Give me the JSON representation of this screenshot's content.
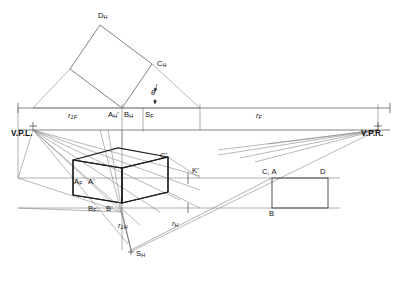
{
  "figure": {
    "kind": "two-point-perspective-construction",
    "background": "#ffffff",
    "line_color": "#6f6f6f",
    "heavy_line_color": "#1c1c1c",
    "text_color": "#0d0d0d",
    "width": 398,
    "height": 281
  },
  "vanishing_points": {
    "left": {
      "label": "V.P.L.",
      "marker": "plus-marker"
    },
    "right": {
      "label": "V.P.R.",
      "marker": "plus-marker"
    }
  },
  "plan_labels": {
    "d_h": {
      "base": "D",
      "sub": "H"
    },
    "c_h": {
      "base": "C",
      "sub": "H"
    },
    "theta": "θ"
  },
  "horizon_labels": {
    "a_h_prime": {
      "base": "A",
      "sub": "H",
      "prime": "'"
    },
    "b_h": {
      "base": "B",
      "sub": "H"
    },
    "s_f": {
      "base": "S",
      "sub": "F"
    }
  },
  "dimensions": {
    "r1f": {
      "base": "r",
      "sub": "1F"
    },
    "rf": {
      "base": "r",
      "sub": "F"
    },
    "r1h": {
      "base": "r",
      "sub": "1H"
    },
    "rh": {
      "base": "r",
      "sub": "H"
    }
  },
  "perspective_box_labels": {
    "c_prime": "C'",
    "k_prime": "K'",
    "a_f": {
      "base": "A",
      "sub": "F"
    },
    "a_prime": "A'",
    "b_f": {
      "base": "B",
      "sub": "F"
    },
    "b_prime": "B'"
  },
  "elevation_labels": {
    "c_a": "C, A",
    "d": "D",
    "b": "B"
  },
  "station_point": {
    "label": {
      "base": "S",
      "sub": "H"
    },
    "marker": "plus-marker"
  }
}
